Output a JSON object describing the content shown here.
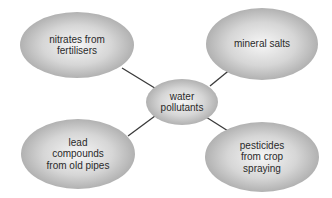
{
  "diagram": {
    "type": "spider-diagram",
    "center": {
      "label": "water\npollutants"
    },
    "nodes": [
      {
        "id": "top-left",
        "label": "nitrates from\nfertilisers"
      },
      {
        "id": "top-right",
        "label": "mineral salts"
      },
      {
        "id": "bottom-left",
        "label": "lead\ncompounds\nfrom old pipes"
      },
      {
        "id": "bottom-right",
        "label": "pesticides\nfrom crop\nspraying"
      }
    ],
    "colors": {
      "bubble_light": "#f4f4f4",
      "bubble_dark": "#a9a9a9",
      "connector": "#3a3a3a",
      "text": "#2a2a2a"
    }
  }
}
